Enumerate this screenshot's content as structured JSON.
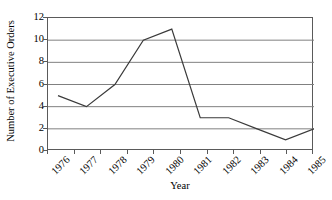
{
  "chart_data": {
    "type": "line",
    "title": "",
    "xlabel": "Year",
    "ylabel": "Number of Executive Orders",
    "categories": [
      "1976",
      "1977",
      "1978",
      "1979",
      "1980",
      "1981",
      "1982",
      "1983",
      "1984",
      "1985"
    ],
    "values": [
      5,
      4,
      6,
      10,
      11,
      3,
      3,
      2,
      1,
      2
    ],
    "series": [
      {
        "name": "Number of Executive Orders",
        "values": [
          5,
          4,
          6,
          10,
          11,
          3,
          3,
          2,
          1,
          2
        ]
      }
    ],
    "ylim": [
      0,
      12
    ],
    "y_ticks": [
      0,
      2,
      4,
      6,
      8,
      10,
      12
    ],
    "y_tick_labels": [
      "0",
      "2",
      "4",
      "6",
      "8",
      "10",
      "12"
    ],
    "grid": "horizontal",
    "legend": "none",
    "line_color": "#3a3a3a",
    "grid_color": "#808080",
    "frame_color": "#5a5a5a",
    "background_color": "#ffffff",
    "x_label_rotation": "-45"
  }
}
